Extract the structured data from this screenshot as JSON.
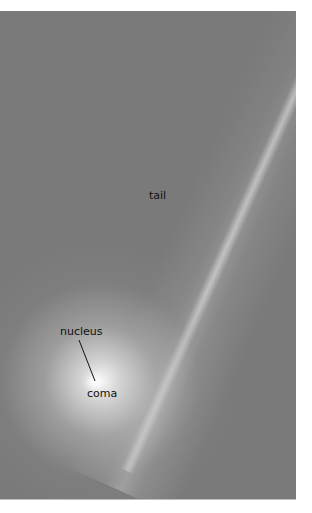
{
  "figure": {
    "labels": {
      "tail": "tail",
      "nucleus": "nucleus",
      "coma": "coma"
    },
    "colors": {
      "background": "#7a7a7a",
      "coma_glow": "#ffffff",
      "label_text": "#111111"
    }
  }
}
